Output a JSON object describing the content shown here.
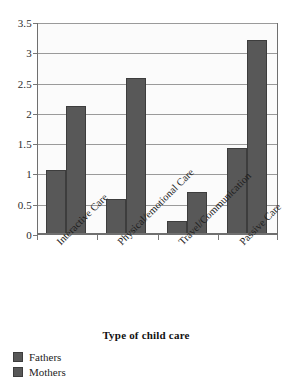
{
  "chart_data": {
    "type": "bar",
    "title": "",
    "xlabel": "Type of child care",
    "ylabel": "",
    "categories": [
      "Interactive Care",
      "Physical/emotional Care",
      "Travel/Communication",
      "Passive Care"
    ],
    "series": [
      {
        "name": "Fathers",
        "values": [
          1.05,
          0.58,
          0.21,
          1.42
        ]
      },
      {
        "name": "Mothers",
        "values": [
          2.11,
          2.58,
          0.7,
          3.2
        ]
      }
    ],
    "ylim": [
      0,
      3.5
    ],
    "yticks": [
      0,
      0.5,
      1,
      1.5,
      2,
      2.5,
      3,
      3.5
    ],
    "ytick_labels": [
      "0",
      "0.5",
      "1",
      "1.5",
      "2",
      "2.5",
      "3",
      "3.5"
    ],
    "grid": true,
    "legend_position": "bottom-left",
    "colors": {
      "bar": "#585858",
      "bar_border": "#3d3d3d",
      "gridline": "#9a9a9a",
      "axis": "#6f6f6f",
      "plot_background": "#fbfbfb",
      "text": "#1d1d1d"
    }
  },
  "legend": {
    "items": [
      {
        "label": "Fathers"
      },
      {
        "label": "Mothers"
      }
    ]
  }
}
